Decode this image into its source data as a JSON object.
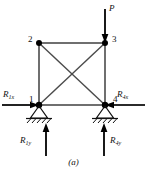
{
  "figure": {
    "caption": "(a)",
    "type": "truss-free-body-diagram",
    "colors": {
      "member": "#6f6f6f",
      "diagonal": "#4a4a4a",
      "node": "#000000",
      "arrow": "#000000",
      "ground": "#222222",
      "text": "#111111",
      "background": "#ffffff"
    }
  },
  "nodes": [
    {
      "id": "1",
      "label": "1",
      "x": 39,
      "y": 105
    },
    {
      "id": "2",
      "label": "2",
      "x": 39,
      "y": 43
    },
    {
      "id": "3",
      "label": "3",
      "x": 105,
      "y": 43
    },
    {
      "id": "4",
      "label": "4",
      "x": 105,
      "y": 105
    }
  ],
  "members": [
    {
      "name": "member-2-3",
      "from": "2",
      "to": "3"
    },
    {
      "name": "member-1-2",
      "from": "1",
      "to": "2"
    },
    {
      "name": "member-3-4",
      "from": "3",
      "to": "4"
    },
    {
      "name": "member-1-4",
      "from": "1",
      "to": "4"
    },
    {
      "name": "diagonal-1-3",
      "from": "1",
      "to": "3"
    },
    {
      "name": "diagonal-2-4",
      "from": "2",
      "to": "4"
    }
  ],
  "loads": [
    {
      "name": "applied-load-P",
      "label": "P",
      "symbol": "P",
      "subscript": "",
      "direction": "down",
      "at_node": "3",
      "label_x": 108,
      "label_y": 5
    }
  ],
  "reactions": [
    {
      "name": "reaction-R1x",
      "symbol": "R",
      "subscript": "1x",
      "label": "R1x",
      "direction": "right",
      "at_node": "1",
      "label_x": 4,
      "label_y": 91
    },
    {
      "name": "reaction-R4x",
      "symbol": "R",
      "subscript": "4x",
      "label": "R4x",
      "direction": "left",
      "at_node": "4",
      "label_x": 118,
      "label_y": 91
    },
    {
      "name": "reaction-R1y",
      "symbol": "R",
      "subscript": "1y",
      "label": "R1y",
      "direction": "up",
      "at_node": "1",
      "label_x": 20,
      "label_y": 137
    },
    {
      "name": "reaction-R4y",
      "symbol": "R",
      "subscript": "4y",
      "label": "R4y",
      "direction": "up",
      "at_node": "4",
      "label_x": 112,
      "label_y": 137
    }
  ],
  "supports": [
    {
      "name": "pin-support-node-1",
      "at_node": "1",
      "kind": "pin"
    },
    {
      "name": "pin-support-node-4",
      "at_node": "4",
      "kind": "pin"
    }
  ],
  "node_labels": {
    "n1": {
      "text": "1",
      "x": 29,
      "y": 96
    },
    "n2": {
      "text": "2",
      "x": 28,
      "y": 35
    },
    "n3": {
      "text": "3",
      "x": 112,
      "y": 35
    },
    "n4": {
      "text": "4",
      "x": 113,
      "y": 96
    }
  }
}
